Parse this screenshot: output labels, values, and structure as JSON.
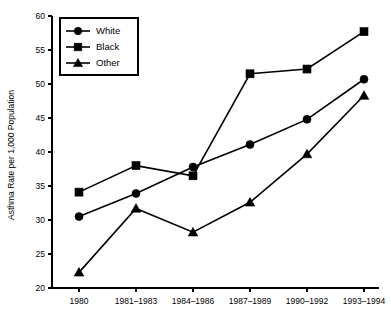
{
  "chart_data": {
    "type": "line",
    "title": "",
    "xlabel": "",
    "ylabel": "Asthma Rate per 1,000 Population",
    "categories": [
      "1980",
      "1981–1983",
      "1984–1986",
      "1987–1989",
      "1990–1992",
      "1993–1994"
    ],
    "ylim": [
      20,
      60
    ],
    "yticks": [
      20,
      25,
      30,
      35,
      40,
      45,
      50,
      55,
      60
    ],
    "ytick_labels": [
      "20",
      "25",
      "30",
      "35",
      "40",
      "45",
      "50",
      "55",
      "60"
    ],
    "grid": false,
    "legend_position": "top-left",
    "series": [
      {
        "name": "White",
        "marker": "circle",
        "color": "#000000",
        "values": [
          30.5,
          33.9,
          37.8,
          41.1,
          44.8,
          50.7
        ]
      },
      {
        "name": "Black",
        "marker": "square",
        "color": "#000000",
        "values": [
          34.1,
          38.0,
          36.5,
          51.5,
          52.2,
          57.7
        ]
      },
      {
        "name": "Other",
        "marker": "triangle",
        "color": "#000000",
        "values": [
          22.3,
          31.7,
          28.2,
          32.6,
          39.7,
          48.3
        ]
      }
    ]
  },
  "legend": {
    "entries": [
      "White",
      "Black",
      "Other"
    ]
  },
  "axes": {
    "y_title": "Asthma Rate per 1,000 Population"
  }
}
